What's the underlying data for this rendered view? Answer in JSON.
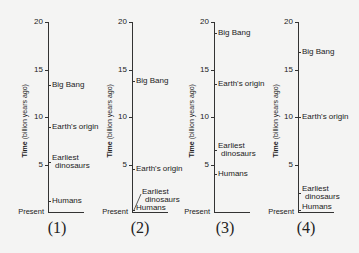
{
  "axis": {
    "title_bold": "Time",
    "title_rest": " (billion years ago)",
    "ticks": [
      "20",
      "15",
      "10",
      "5"
    ],
    "present_label": "Present",
    "min": 0,
    "max": 20
  },
  "panels": [
    {
      "label": "(1)",
      "events": [
        {
          "name": "Big Bang",
          "line1": "Big Bang",
          "line2": "",
          "value": 13.4
        },
        {
          "name": "Earth's origin",
          "line1": "Earth's origin",
          "line2": "",
          "value": 9.0
        },
        {
          "name": "Earliest dinosaurs",
          "line1": "Earliest",
          "line2": "dinosaurs",
          "value": 5.3
        },
        {
          "name": "Humans",
          "line1": "Humans",
          "line2": "",
          "value": 1.2
        }
      ]
    },
    {
      "label": "(2)",
      "events": [
        {
          "name": "Big Bang",
          "line1": "Big Bang",
          "line2": "",
          "value": 13.8
        },
        {
          "name": "Earth's origin",
          "line1": "Earth's origin",
          "line2": "",
          "value": 4.5
        },
        {
          "name": "Earliest dinosaurs",
          "line1": "Earliest",
          "line2": "dinosaurs",
          "value": 0.2
        },
        {
          "name": "Humans",
          "line1": "Humans",
          "line2": "",
          "value": 0.0
        }
      ]
    },
    {
      "label": "(3)",
      "events": [
        {
          "name": "Big Bang",
          "line1": "Big Bang",
          "line2": "",
          "value": 18.8
        },
        {
          "name": "Earth's origin",
          "line1": "Earth's origin",
          "line2": "",
          "value": 13.5
        },
        {
          "name": "Earliest dinosaurs",
          "line1": "Earliest",
          "line2": "dinosaurs",
          "value": 6.5
        },
        {
          "name": "Humans",
          "line1": "Humans",
          "line2": "",
          "value": 4.0
        }
      ]
    },
    {
      "label": "(4)",
      "events": [
        {
          "name": "Big Bang",
          "line1": "Big Bang",
          "line2": "",
          "value": 16.8
        },
        {
          "name": "Earth's origin",
          "line1": "Earth's origin",
          "line2": "",
          "value": 10.0
        },
        {
          "name": "Earliest dinosaurs",
          "line1": "Earliest",
          "line2": "dinosaurs",
          "value": 2.0
        },
        {
          "name": "Humans",
          "line1": "Humans",
          "line2": "",
          "value": 0.2
        }
      ]
    }
  ]
}
